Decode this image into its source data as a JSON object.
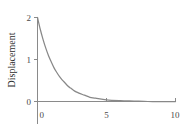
{
  "chart_data": {
    "type": "line",
    "title": "",
    "subtitle": "",
    "xlabel": "",
    "ylabel": "Displacement",
    "xlim": [
      0,
      10
    ],
    "ylim": [
      0,
      2
    ],
    "xticks": [
      0,
      5,
      10
    ],
    "xticklabels": [
      "0",
      "5",
      "10"
    ],
    "yticks": [
      0,
      1,
      2
    ],
    "yticklabels": [
      "0",
      "1",
      "2"
    ],
    "grid": false,
    "legend": null,
    "annotations": [],
    "series": [
      {
        "name": "displacement",
        "color": "#888888",
        "x": [
          0,
          0.2,
          0.4,
          0.6,
          0.8,
          1.0,
          1.2,
          1.4,
          1.6,
          1.8,
          2.0,
          2.2,
          2.4,
          2.6,
          2.8,
          3.0,
          3.4,
          3.8,
          4.2,
          5.0,
          6.0,
          7.0,
          8.0,
          9.0,
          10.0
        ],
        "y": [
          2.0,
          1.72,
          1.48,
          1.27,
          1.09,
          0.94,
          0.8,
          0.69,
          0.59,
          0.51,
          0.44,
          0.37,
          0.32,
          0.27,
          0.23,
          0.2,
          0.15,
          0.1,
          0.08,
          0.04,
          0.02,
          0.01,
          0.0,
          0.0,
          0.0
        ]
      }
    ]
  },
  "axis_labels": {
    "y_title": "Displacement",
    "y_tick_0": "0",
    "y_tick_1": "1",
    "y_tick_2": "2",
    "x_tick_0": "0",
    "x_tick_5": "5",
    "x_tick_10": "10"
  },
  "colors": {
    "curve": "#888888",
    "axis": "#8a8a8a",
    "text": "#2e2e2e",
    "background": "#ffffff"
  }
}
